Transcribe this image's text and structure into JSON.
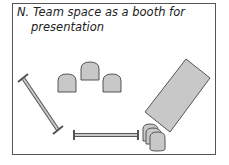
{
  "diagram": {
    "title_line1": "N. Team space as a booth for",
    "title_line2": "presentation",
    "colors": {
      "fill": "#c8c8c8",
      "stroke": "#555555",
      "frame": "#555555"
    },
    "elements": [
      {
        "type": "chair",
        "label": "seat-left"
      },
      {
        "type": "chair",
        "label": "seat-center"
      },
      {
        "type": "chair",
        "label": "seat-right"
      },
      {
        "type": "stanchion-barrier",
        "label": "barrier-diagonal"
      },
      {
        "type": "stanchion-barrier",
        "label": "barrier-horizontal"
      },
      {
        "type": "table",
        "label": "presentation-table"
      },
      {
        "type": "stacked-chairs",
        "label": "chair-stack",
        "count": 3
      }
    ]
  }
}
